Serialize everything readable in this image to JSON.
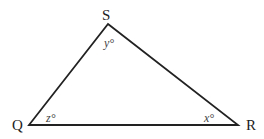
{
  "diagram": {
    "type": "triangle",
    "vertices": {
      "S": {
        "label": "S",
        "x": 108,
        "y": 24
      },
      "Q": {
        "label": "Q",
        "x": 29,
        "y": 125
      },
      "R": {
        "label": "R",
        "x": 238,
        "y": 125
      }
    },
    "angles": {
      "S": {
        "label": "y°"
      },
      "Q": {
        "label": "z°"
      },
      "R": {
        "label": "x°"
      }
    },
    "line_color": "#222222"
  }
}
